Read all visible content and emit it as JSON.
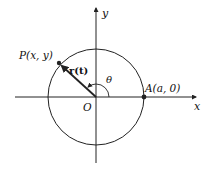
{
  "diagram": {
    "type": "circle-position-vector",
    "labels": {
      "y_axis": "y",
      "x_axis": "x",
      "point_p": "P(x, y)",
      "vector": "r(t)",
      "angle": "θ",
      "origin": "O",
      "point_a": "A(a, 0)"
    },
    "colors": {
      "stroke": "#222222",
      "background": "#ffffff"
    }
  }
}
